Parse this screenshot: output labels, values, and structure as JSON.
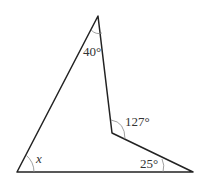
{
  "diagram": {
    "type": "geometry-concave-quadrilateral",
    "vertices": {
      "top": [
        98,
        16
      ],
      "bottom_left": [
        17,
        172
      ],
      "bottom_right": [
        193,
        172
      ],
      "reflex": [
        112,
        133
      ]
    },
    "angles": {
      "top": "40°",
      "reflex": "127°",
      "bottom_right": "25°",
      "bottom_left": "x"
    },
    "stroke_color": "#222222"
  }
}
